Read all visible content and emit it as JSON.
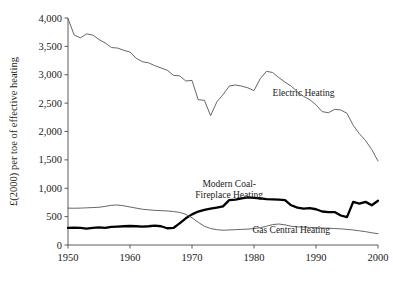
{
  "chart_data": {
    "type": "line",
    "title": "",
    "xlabel": "",
    "ylabel": "£(2000) per toe of effective heating",
    "xlim": [
      1950,
      2000
    ],
    "ylim": [
      0,
      4000
    ],
    "grid": false,
    "legend_position": "inline-annotations",
    "xticks": [
      "1950",
      "1960",
      "1970",
      "1980",
      "1990",
      "2000"
    ],
    "xtick_values": [
      1950,
      1960,
      1970,
      1980,
      1990,
      2000
    ],
    "yticks": [
      "0",
      "500",
      "1,000",
      "1,500",
      "2,000",
      "2,500",
      "3,000",
      "3,500",
      "4,000"
    ],
    "ytick_values": [
      0,
      500,
      1000,
      1500,
      2000,
      2500,
      3000,
      3500,
      4000
    ],
    "x": [
      1950,
      1951,
      1952,
      1953,
      1954,
      1955,
      1956,
      1957,
      1958,
      1959,
      1960,
      1961,
      1962,
      1963,
      1964,
      1965,
      1966,
      1967,
      1968,
      1969,
      1970,
      1971,
      1972,
      1973,
      1974,
      1975,
      1976,
      1977,
      1978,
      1979,
      1980,
      1981,
      1982,
      1983,
      1984,
      1985,
      1986,
      1987,
      1988,
      1989,
      1990,
      1991,
      1992,
      1993,
      1994,
      1995,
      1996,
      1997,
      1998,
      1999,
      2000
    ],
    "series": [
      {
        "name": "Electric Heating",
        "style": "thin",
        "label_x": 1988,
        "label_y": 2620,
        "values": [
          3990,
          3700,
          3650,
          3720,
          3700,
          3620,
          3560,
          3480,
          3470,
          3430,
          3400,
          3290,
          3230,
          3210,
          3160,
          3120,
          3080,
          2990,
          2980,
          2890,
          2900,
          2560,
          2550,
          2280,
          2520,
          2650,
          2800,
          2820,
          2800,
          2770,
          2720,
          2930,
          3060,
          3040,
          2950,
          2870,
          2800,
          2700,
          2620,
          2560,
          2470,
          2350,
          2330,
          2390,
          2380,
          2320,
          2110,
          1960,
          1840,
          1680,
          1480
        ]
      },
      {
        "name": "Modern Coal-Fireplace Heating",
        "style": "bold",
        "label_x": 1976,
        "label_y": 1030,
        "label_line1": "Modern Coal-",
        "label_line2": "Fireplace Heating",
        "values": [
          300,
          305,
          300,
          290,
          300,
          310,
          300,
          320,
          325,
          330,
          335,
          330,
          325,
          330,
          340,
          330,
          295,
          300,
          380,
          470,
          540,
          590,
          620,
          640,
          660,
          680,
          790,
          800,
          820,
          840,
          830,
          820,
          810,
          805,
          800,
          790,
          700,
          660,
          640,
          650,
          630,
          590,
          580,
          580,
          520,
          490,
          760,
          730,
          760,
          700,
          780
        ]
      },
      {
        "name": "Gas Central Heating",
        "style": "thin",
        "label_x": 1986,
        "label_y": 215,
        "values": [
          650,
          648,
          650,
          655,
          660,
          665,
          680,
          700,
          705,
          690,
          670,
          650,
          630,
          620,
          610,
          605,
          600,
          590,
          575,
          540,
          480,
          400,
          330,
          290,
          270,
          260,
          265,
          270,
          275,
          280,
          290,
          305,
          330,
          360,
          370,
          355,
          330,
          320,
          315,
          310,
          305,
          300,
          295,
          290,
          285,
          275,
          265,
          250,
          235,
          215,
          200
        ]
      }
    ]
  }
}
